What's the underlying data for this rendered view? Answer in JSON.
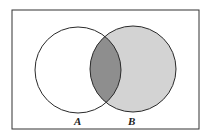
{
  "diagram": {
    "type": "venn",
    "frame": {
      "x": 12,
      "y": 10,
      "width": 187,
      "height": 119
    },
    "sets": [
      {
        "label": "A",
        "cx": 78,
        "cy": 70,
        "r": 43,
        "fill": "#ffffff"
      },
      {
        "label": "B",
        "cx": 133,
        "cy": 69,
        "r": 43,
        "fill": "#d3d3d3"
      }
    ],
    "intersection_fill": "#8e8e8e",
    "stroke": "#2a2a2a",
    "labels": {
      "a": "A",
      "b": "B"
    }
  }
}
